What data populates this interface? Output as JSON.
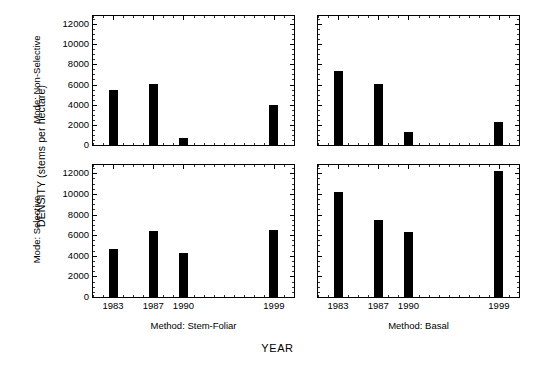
{
  "chart_data": {
    "type": "bar",
    "title": "",
    "xlabel": "YEAR",
    "ylabel": "DENSITY (stems per hectare)",
    "ylim": [
      0,
      12800
    ],
    "yticks": [
      0,
      2000,
      4000,
      6000,
      8000,
      10000,
      12000
    ],
    "ytick_labels": [
      "0",
      "2000",
      "4000",
      "6000",
      "8000",
      "10000",
      "12000"
    ],
    "xlim": [
      1981,
      2001
    ],
    "categories": [
      1983,
      1987,
      1990,
      1999
    ],
    "xtick_labels": [
      "1983",
      "1987",
      "1990",
      "1999"
    ],
    "grid": false,
    "legend": "none",
    "layout": "2x2 trellis: rows = Mode, columns = Method",
    "row_variable": "Mode",
    "col_variable": "Method",
    "row_labels": [
      "Mode: Non-Selective",
      "Mode: Selective"
    ],
    "col_labels": [
      "Method: Stem-Foliar",
      "Method: Basal"
    ],
    "panels": [
      {
        "row": 0,
        "col": 0,
        "row_label": "Mode: Non-Selective",
        "col_label": "Method: Stem-Foliar",
        "x": [
          1983,
          1987,
          1990,
          1999
        ],
        "values": [
          5500,
          6100,
          650,
          4000
        ]
      },
      {
        "row": 0,
        "col": 1,
        "row_label": "Mode: Non-Selective",
        "col_label": "Method: Basal",
        "x": [
          1983,
          1987,
          1990,
          1999
        ],
        "values": [
          7300,
          6100,
          1300,
          2300
        ]
      },
      {
        "row": 1,
        "col": 0,
        "row_label": "Mode: Selective",
        "col_label": "Method: Stem-Foliar",
        "x": [
          1983,
          1987,
          1990,
          1999
        ],
        "values": [
          4700,
          6400,
          4300,
          6500
        ]
      },
      {
        "row": 1,
        "col": 1,
        "row_label": "Mode: Selective",
        "col_label": "Method: Basal",
        "x": [
          1983,
          1987,
          1990,
          1999
        ],
        "values": [
          10200,
          7500,
          6300,
          12200
        ]
      }
    ],
    "bar_color": "#000000"
  }
}
